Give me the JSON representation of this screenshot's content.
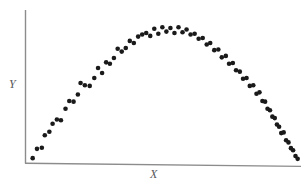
{
  "chart_data": {
    "type": "scatter",
    "title": "",
    "subtitle": "",
    "xlabel": "X",
    "ylabel": "Y",
    "xlim": [
      0,
      100
    ],
    "ylim": [
      0,
      100
    ],
    "grid": false,
    "legend": null,
    "annotations": [],
    "axis_ticks": {
      "x": [],
      "y": []
    },
    "relationship": "inverted-U (quadratic) curvilinear relationship between X and Y",
    "marker": {
      "shape": "circle",
      "filled": true,
      "color": "#1a1a1a",
      "size_px": 4.6
    },
    "n_points": 75,
    "points": [
      [
        1.0,
        2.0
      ],
      [
        2.6,
        8.5
      ],
      [
        4.4,
        9.3
      ],
      [
        5.5,
        18.0
      ],
      [
        7.2,
        20.5
      ],
      [
        8.4,
        26.0
      ],
      [
        10.0,
        29.0
      ],
      [
        11.5,
        28.5
      ],
      [
        13.2,
        36.5
      ],
      [
        14.6,
        42.0
      ],
      [
        16.2,
        41.5
      ],
      [
        17.8,
        46.5
      ],
      [
        18.8,
        54.5
      ],
      [
        20.4,
        53.0
      ],
      [
        22.2,
        52.5
      ],
      [
        23.9,
        58.0
      ],
      [
        25.3,
        65.0
      ],
      [
        26.8,
        61.5
      ],
      [
        28.3,
        69.0
      ],
      [
        29.7,
        68.0
      ],
      [
        31.2,
        72.0
      ],
      [
        32.6,
        78.5
      ],
      [
        34.1,
        76.5
      ],
      [
        35.6,
        79.0
      ],
      [
        37.1,
        84.0
      ],
      [
        38.6,
        82.5
      ],
      [
        40.2,
        87.0
      ],
      [
        41.7,
        88.5
      ],
      [
        43.2,
        89.5
      ],
      [
        44.7,
        87.5
      ],
      [
        46.2,
        92.5
      ],
      [
        47.7,
        89.0
      ],
      [
        49.2,
        93.5
      ],
      [
        50.7,
        90.5
      ],
      [
        52.2,
        93.0
      ],
      [
        53.7,
        89.5
      ],
      [
        55.2,
        93.5
      ],
      [
        56.7,
        90.0
      ],
      [
        58.2,
        92.0
      ],
      [
        59.7,
        88.5
      ],
      [
        61.2,
        89.0
      ],
      [
        62.7,
        85.5
      ],
      [
        64.2,
        86.0
      ],
      [
        65.7,
        81.5
      ],
      [
        67.0,
        82.5
      ],
      [
        68.5,
        77.5
      ],
      [
        70.0,
        78.0
      ],
      [
        71.3,
        72.5
      ],
      [
        72.8,
        73.5
      ],
      [
        74.0,
        68.0
      ],
      [
        75.4,
        68.5
      ],
      [
        76.6,
        63.5
      ],
      [
        78.0,
        62.5
      ],
      [
        79.2,
        57.5
      ],
      [
        80.5,
        58.0
      ],
      [
        81.7,
        52.5
      ],
      [
        83.0,
        53.0
      ],
      [
        84.2,
        47.0
      ],
      [
        85.3,
        48.0
      ],
      [
        86.4,
        42.0
      ],
      [
        87.4,
        41.5
      ],
      [
        88.3,
        36.5
      ],
      [
        89.2,
        35.5
      ],
      [
        90.1,
        31.0
      ],
      [
        91.0,
        30.0
      ],
      [
        91.8,
        25.5
      ],
      [
        92.6,
        24.0
      ],
      [
        93.4,
        19.5
      ],
      [
        94.3,
        20.0
      ],
      [
        95.2,
        14.5
      ],
      [
        96.1,
        13.0
      ],
      [
        97.0,
        9.0
      ],
      [
        97.8,
        7.5
      ],
      [
        98.7,
        3.5
      ],
      [
        99.5,
        1.5
      ]
    ]
  },
  "figure": {
    "axis_color": "#8c8c8e",
    "point_color": "#1a1a1a",
    "background": "#ffffff"
  }
}
